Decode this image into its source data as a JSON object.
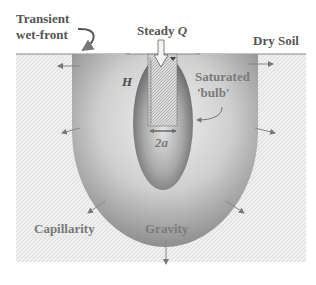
{
  "diagram": {
    "labels": {
      "transient_line1": "Transient",
      "transient_line2": "wet-front",
      "steady_q_prefix": "Steady ",
      "steady_q_symbol": "Q",
      "dry_soil": "Dry Soil",
      "H": "H",
      "saturated_line1": "Saturated",
      "saturated_line2": "'bulb'",
      "two_a": "2a",
      "capillarity": "Capillarity",
      "gravity": "Gravity"
    },
    "colors": {
      "dry_soil_fill": "#ebebeb",
      "wet_front_outer": "#9a9a9a",
      "wet_front_inner": "#e6e6e6",
      "bulb_outer": "#6e6e6e",
      "bulb_inner": "#cfcfcf",
      "text": "#555555"
    }
  }
}
